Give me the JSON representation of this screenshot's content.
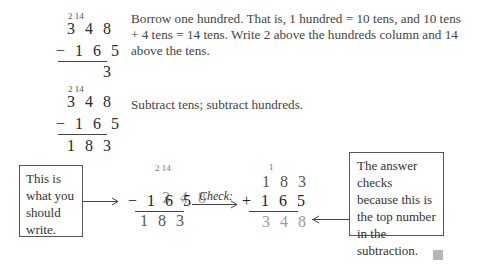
{
  "step1": {
    "borrow_marks": "2 14",
    "top": "3 4 8",
    "bottom": "− 1 6 5",
    "result": "3",
    "text": "Borrow one hundred. That is, 1 hundred = 10 tens, and 10 tens + 4 tens = 14 tens. Write 2 above the hundreds column and 14 above the tens."
  },
  "step2": {
    "borrow_marks": "2 14",
    "top": "3 4 8",
    "bottom": "− 1 6 5",
    "result": "1 8 3",
    "text": "Subtract tens; subtract hundreds."
  },
  "diagram": {
    "left_box": "This is what you should write.",
    "subtraction": {
      "borrow_marks": "2 14",
      "top_digits": [
        "3",
        "4",
        "8"
      ],
      "bottom": "− 1 6 5",
      "result": "1 8 3"
    },
    "check_label": "Check:",
    "addition": {
      "carry_mark": "1",
      "top": "1 8 3",
      "bottom": "+ 1 6 5",
      "result": "3 4 8"
    },
    "right_box": "The answer checks because this is the top number in the subtraction."
  }
}
